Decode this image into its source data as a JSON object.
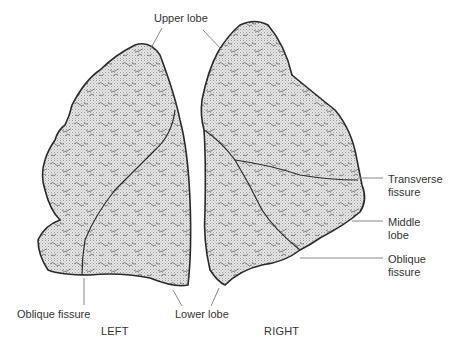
{
  "diagram": {
    "colors": {
      "outline": "#2a2a2a",
      "fill": "#d9d9d9",
      "texture": "#555555",
      "leader_line": "#888888",
      "text": "#333333",
      "background": "#ffffff"
    },
    "labels": {
      "upper_lobe": "Upper lobe",
      "transverse_fissure_line1": "Transverse",
      "transverse_fissure_line2": "fissure",
      "middle_lobe_line1": "Middle",
      "middle_lobe_line2": "lobe",
      "oblique_fissure_right_line1": "Oblique",
      "oblique_fissure_right_line2": "fissure",
      "oblique_fissure_left": "Oblique fissure",
      "lower_lobe": "Lower lobe"
    },
    "sides": {
      "left": "LEFT",
      "right": "RIGHT"
    }
  }
}
